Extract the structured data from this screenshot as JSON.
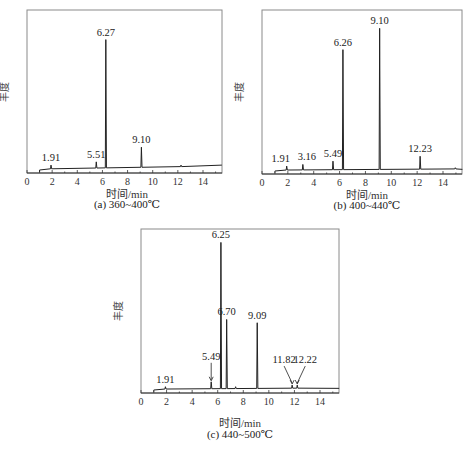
{
  "figure": {
    "panels": [
      {
        "id": "a",
        "caption": "(a) 360~400℃",
        "xlabel": "时间/min",
        "ylabel": "丰度"
      },
      {
        "id": "b",
        "caption": "(b) 400~440℃",
        "xlabel": "时间/min",
        "ylabel": "丰度"
      },
      {
        "id": "c",
        "caption": "(c) 440~500℃",
        "xlabel": "时间/min",
        "ylabel": "丰度"
      }
    ],
    "x_ticks": [
      "0",
      "2",
      "4",
      "6",
      "8",
      "10",
      "12",
      "14"
    ]
  },
  "chart_data": [
    {
      "type": "line",
      "title": "(a) 360~400℃",
      "xlabel": "时间/min",
      "ylabel": "丰度",
      "xlim": [
        0,
        15.5
      ],
      "ylim": [
        0,
        1
      ],
      "grid": false,
      "x_ticks": [
        0,
        2,
        4,
        6,
        8,
        10,
        12,
        14
      ],
      "peaks": [
        {
          "x": 1.91,
          "label": "1.91",
          "rel_height": 0.03
        },
        {
          "x": 5.51,
          "label": "5.51",
          "rel_height": 0.05
        },
        {
          "x": 6.27,
          "label": "6.27",
          "rel_height": 0.8
        },
        {
          "x": 9.1,
          "label": "9.10",
          "rel_height": 0.14
        },
        {
          "x": 12.25,
          "label": "",
          "rel_height": 0.03
        }
      ]
    },
    {
      "type": "line",
      "title": "(b) 400~440℃",
      "xlabel": "时间/min",
      "ylabel": "丰度",
      "xlim": [
        0,
        15.5
      ],
      "ylim": [
        0,
        1
      ],
      "grid": false,
      "x_ticks": [
        0,
        2,
        4,
        6,
        8,
        10,
        12,
        14
      ],
      "peaks": [
        {
          "x": 1.91,
          "label": "1.91",
          "rel_height": 0.03
        },
        {
          "x": 3.16,
          "label": "3.16",
          "rel_height": 0.04
        },
        {
          "x": 5.49,
          "label": "5.49",
          "rel_height": 0.06
        },
        {
          "x": 6.26,
          "label": "6.26",
          "rel_height": 0.74
        },
        {
          "x": 9.1,
          "label": "9.10",
          "rel_height": 0.87
        },
        {
          "x": 12.23,
          "label": "12.23",
          "rel_height": 0.09
        },
        {
          "x": 14.95,
          "label": "",
          "rel_height": 0.02
        }
      ]
    },
    {
      "type": "line",
      "title": "(c) 440~500℃",
      "xlabel": "时间/min",
      "ylabel": "丰度",
      "xlim": [
        0,
        15.5
      ],
      "ylim": [
        0,
        1
      ],
      "grid": false,
      "x_ticks": [
        0,
        2,
        4,
        6,
        8,
        10,
        12,
        14
      ],
      "peaks": [
        {
          "x": 1.91,
          "label": "1.91",
          "rel_height": 0.02
        },
        {
          "x": 5.49,
          "label": "5.49",
          "rel_height": 0.05,
          "arrow": true
        },
        {
          "x": 6.25,
          "label": "6.25",
          "rel_height": 0.9
        },
        {
          "x": 6.7,
          "label": "6.70",
          "rel_height": 0.43
        },
        {
          "x": 7.4,
          "label": "",
          "rel_height": 0.02
        },
        {
          "x": 9.09,
          "label": "9.09",
          "rel_height": 0.41
        },
        {
          "x": 11.82,
          "label": "11.82",
          "rel_height": 0.03,
          "arrow": true
        },
        {
          "x": 12.22,
          "label": "12.22",
          "rel_height": 0.03,
          "arrow": true
        }
      ]
    }
  ]
}
